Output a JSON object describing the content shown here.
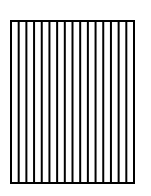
{
  "diagram": {
    "shape": "rectangle",
    "fill_pattern": "vertical-stripes",
    "stroke_color": "#000000",
    "background_color": "#ffffff",
    "stroke_width": 2,
    "rect": {
      "x": 11,
      "y": 21,
      "width": 123,
      "height": 162
    },
    "stripe_count": 16,
    "vertical_line_count": 17
  }
}
